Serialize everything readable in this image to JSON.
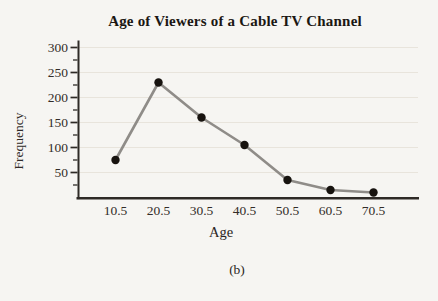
{
  "figure": {
    "caption": "(b)"
  },
  "chart_data": {
    "type": "line",
    "title": "Age of Viewers of a Cable TV Channel",
    "xlabel": "Age",
    "ylabel": "Frequency",
    "categories": [
      "10.5",
      "20.5",
      "30.5",
      "40.5",
      "50.5",
      "60.5",
      "70.5"
    ],
    "x_values": [
      10.5,
      20.5,
      30.5,
      40.5,
      50.5,
      60.5,
      70.5
    ],
    "values": [
      75,
      230,
      160,
      105,
      35,
      15,
      10
    ],
    "y_ticks": [
      50,
      100,
      150,
      200,
      250,
      300
    ],
    "y_minor_ticks": [
      25,
      75,
      125,
      175,
      225,
      275
    ],
    "ylim": [
      0,
      300
    ],
    "grid": "horizontal-major",
    "legend": "none",
    "marker": "filled-circle",
    "colors": {
      "line": "#8f8c88",
      "point": "#17130f",
      "grid": "#e8e4dc",
      "axis": "#2e2a26",
      "text": "#332d29",
      "background": "#f6f5f2"
    }
  }
}
